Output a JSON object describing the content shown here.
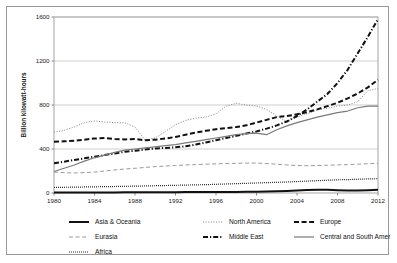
{
  "chart_data": {
    "type": "line",
    "title": "",
    "xlabel": "",
    "ylabel": "Billion kilowatt-hours",
    "xlim": [
      1980,
      2012
    ],
    "ylim": [
      0,
      1600
    ],
    "yticks": [
      0,
      400,
      800,
      1200,
      1600
    ],
    "xticks": [
      1980,
      1984,
      1988,
      1992,
      1996,
      2000,
      2004,
      2008,
      2012
    ],
    "grid": "horizontal",
    "legend_position": "bottom",
    "x": [
      1980,
      1981,
      1982,
      1983,
      1984,
      1985,
      1986,
      1987,
      1988,
      1989,
      1990,
      1991,
      1992,
      1993,
      1994,
      1995,
      1996,
      1997,
      1998,
      1999,
      2000,
      2001,
      2002,
      2003,
      2004,
      2005,
      2006,
      2007,
      2008,
      2009,
      2010,
      2011,
      2012
    ],
    "series": [
      {
        "name": "Asia & Oceania",
        "style": "solid-thick-black",
        "color": "#111111",
        "values": [
          4,
          4,
          4,
          5,
          5,
          5,
          5,
          6,
          6,
          6,
          7,
          7,
          7,
          8,
          8,
          8,
          9,
          9,
          10,
          11,
          12,
          14,
          16,
          19,
          23,
          27,
          30,
          29,
          26,
          22,
          22,
          26,
          30
        ]
      },
      {
        "name": "North America",
        "style": "dotted",
        "color": "#8e8e8e",
        "values": [
          552,
          570,
          600,
          640,
          655,
          645,
          640,
          638,
          600,
          480,
          500,
          560,
          620,
          660,
          680,
          690,
          720,
          790,
          815,
          800,
          790,
          760,
          700,
          650,
          690,
          720,
          755,
          770,
          790,
          800,
          830,
          930,
          950
        ]
      },
      {
        "name": "Europe",
        "style": "dashed-thick",
        "color": "#111111",
        "values": [
          465,
          470,
          475,
          485,
          495,
          500,
          492,
          487,
          490,
          480,
          485,
          495,
          510,
          530,
          550,
          565,
          580,
          590,
          600,
          615,
          640,
          665,
          690,
          700,
          715,
          735,
          760,
          790,
          820,
          860,
          905,
          960,
          1030
        ]
      },
      {
        "name": "Eurasia",
        "style": "dashed-light",
        "color": "#9a9a9a",
        "values": [
          190,
          185,
          182,
          185,
          190,
          200,
          210,
          218,
          225,
          232,
          240,
          245,
          250,
          255,
          258,
          262,
          265,
          268,
          270,
          272,
          272,
          268,
          262,
          255,
          250,
          248,
          250,
          252,
          255,
          258,
          262,
          266,
          270
        ]
      },
      {
        "name": "Middle East",
        "style": "dash-dot-thick",
        "color": "#111111",
        "values": [
          270,
          285,
          300,
          315,
          330,
          345,
          360,
          375,
          385,
          395,
          405,
          410,
          415,
          425,
          440,
          460,
          480,
          500,
          520,
          540,
          560,
          585,
          615,
          650,
          700,
          760,
          830,
          900,
          1000,
          1120,
          1270,
          1420,
          1580
        ]
      },
      {
        "name": "Central and South America",
        "style": "solid-thin-gray",
        "color": "#7a7a7a",
        "values": [
          195,
          225,
          255,
          290,
          320,
          345,
          370,
          390,
          400,
          410,
          420,
          430,
          440,
          455,
          470,
          485,
          500,
          515,
          530,
          540,
          545,
          530,
          575,
          610,
          640,
          665,
          690,
          710,
          730,
          745,
          775,
          790,
          790
        ]
      },
      {
        "name": "Africa",
        "style": "dotted-fine",
        "color": "#111111",
        "values": [
          50,
          52,
          53,
          55,
          56,
          58,
          59,
          61,
          62,
          64,
          66,
          68,
          70,
          72,
          74,
          76,
          79,
          82,
          85,
          88,
          91,
          94,
          97,
          100,
          104,
          108,
          112,
          116,
          120,
          122,
          125,
          128,
          130
        ]
      }
    ]
  },
  "legend": {
    "items": [
      {
        "label": "Asia & Oceania",
        "swatch": "solid-thick-black"
      },
      {
        "label": "North America",
        "swatch": "dotted"
      },
      {
        "label": "Europe",
        "swatch": "dashed-thick"
      },
      {
        "label": "Eurasia",
        "swatch": "dashed-light"
      },
      {
        "label": "Middle East",
        "swatch": "dash-dot-thick"
      },
      {
        "label": "Central and South America",
        "swatch": "solid-thin-gray"
      },
      {
        "label": "Africa",
        "swatch": "dotted-fine"
      }
    ]
  }
}
